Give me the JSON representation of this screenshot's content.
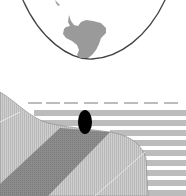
{
  "figure": {
    "globe": {
      "description": "Lower portion of globe outline showing Antarctica",
      "outline_color": "#444444",
      "land_color": "#9a9a9a"
    },
    "cross_section": {
      "description": "Schematic cross-section with ice slope, dark diagonal band, layered water stripes and black marker",
      "hatch_light": "#c4c4c4",
      "band_dark": "#8a8a8a",
      "stripe_color": "#bcbcbc",
      "marker_color": "#000000"
    }
  }
}
